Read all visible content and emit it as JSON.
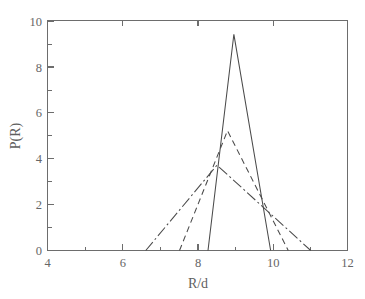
{
  "chart_data": {
    "type": "line",
    "title": "",
    "xlabel": "R/d",
    "ylabel": "P(R)",
    "xlim": [
      4,
      12
    ],
    "ylim": [
      0,
      10
    ],
    "xticks": [
      4,
      6,
      8,
      10,
      12
    ],
    "xtick_labels": [
      "4",
      "6",
      "8",
      "10",
      "12"
    ],
    "xticks_minor": [
      5,
      7,
      9,
      11
    ],
    "yticks": [
      0,
      2,
      4,
      6,
      8,
      10
    ],
    "ytick_labels": [
      "0",
      "2",
      "4",
      "6",
      "8",
      "10"
    ],
    "grid": false,
    "legend": "none",
    "line_color": "#4a4a4a",
    "series": [
      {
        "name": "narrow",
        "style": "solid",
        "dasharray": "none",
        "points": [
          [
            8.28,
            0.0
          ],
          [
            8.97,
            9.42
          ],
          [
            9.95,
            0.0
          ]
        ]
      },
      {
        "name": "intermediate",
        "style": "dashed",
        "dasharray": "6,4",
        "points": [
          [
            7.52,
            0.0
          ],
          [
            8.8,
            5.22
          ],
          [
            10.42,
            0.0
          ]
        ]
      },
      {
        "name": "broad",
        "style": "dash-dot",
        "dasharray": "11,3,2,3",
        "points": [
          [
            6.62,
            0.0
          ],
          [
            8.52,
            3.72
          ],
          [
            11.02,
            0.0
          ]
        ]
      }
    ]
  },
  "axis": {
    "x_label": "R/d",
    "y_label": "P(R)"
  }
}
